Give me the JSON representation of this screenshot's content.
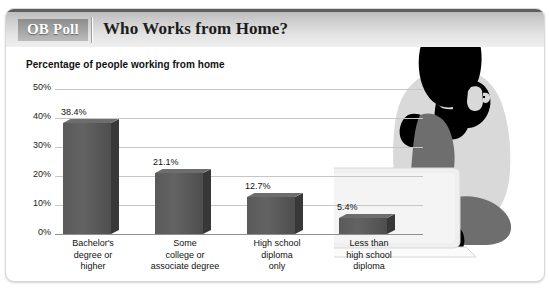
{
  "header": {
    "brand": "OB Poll",
    "title": "Who Works from Home?"
  },
  "chart_data": {
    "type": "bar",
    "title": "Who Works from Home?",
    "subtitle": "Percentage of people working from home",
    "xlabel": "",
    "ylabel": "",
    "ylim": [
      0,
      50
    ],
    "ytick_labels": [
      "50%",
      "40%",
      "30%",
      "20%",
      "10%",
      "0%"
    ],
    "ytick_values": [
      50,
      40,
      30,
      20,
      10,
      0
    ],
    "grid": true,
    "legend": "none",
    "categories": [
      "Bachelor's degree or higher",
      "Some college or associate degree",
      "High school diploma only",
      "Less than high school diploma"
    ],
    "category_lines": [
      [
        "Bachelor's",
        "degree or",
        "higher"
      ],
      [
        "Some",
        "college or",
        "associate degree"
      ],
      [
        "High school",
        "diploma",
        "only"
      ],
      [
        "Less than",
        "high school",
        "diploma"
      ]
    ],
    "values": [
      38.4,
      21.1,
      12.7,
      5.4
    ],
    "value_labels": [
      "38.4%",
      "21.1%",
      "12.7%",
      "5.4%"
    ],
    "bar_color": "#5a5a5a",
    "bar_side_color": "#383838",
    "bar_top_color": "#6d6d6d",
    "gridline_color": "#c6c6c6"
  },
  "artwork": {
    "name": "person-with-laptop-silhouette",
    "body_color": "#d9d9d9",
    "head_color": "#000000",
    "leg_color": "#6e6e6e",
    "laptop_color": "#eeeeee"
  },
  "card": {
    "background": "#ffffff",
    "border_color": "#d8d8d8",
    "header_top_rule": "#5e5e5e"
  }
}
